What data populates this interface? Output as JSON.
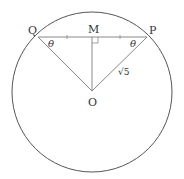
{
  "diagram": {
    "points": {
      "Q": "Q",
      "M": "M",
      "P": "P",
      "O": "O"
    },
    "angle_left": "θ",
    "angle_right": "θ",
    "segment_OP": "√5",
    "colors": {
      "circle": "#555555",
      "lines": "#888888",
      "text": "#333333"
    }
  }
}
